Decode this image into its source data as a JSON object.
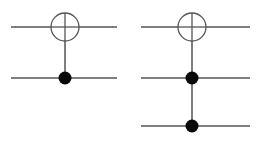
{
  "figure": {
    "width": 261,
    "height": 151,
    "background_color": "#ffffff",
    "wire_color": "#7f7f7f",
    "circle_stroke_color": "#555555",
    "circle_fill_color": "#ffffff",
    "dot_color": "#0a0a0a"
  },
  "circuits": [
    {
      "id": "cnot",
      "name": "CNOT gate",
      "label": "",
      "wire_count": 2,
      "x_start": 11,
      "x_end": 117,
      "gate_x": 65,
      "wires": [
        {
          "index": 0,
          "y": 27,
          "role": "target"
        },
        {
          "index": 1,
          "y": 78,
          "role": "control"
        }
      ],
      "target": {
        "cx": 65,
        "cy": 27,
        "r": 14,
        "symbol": "oplus"
      },
      "controls": [
        {
          "cx": 65,
          "cy": 78,
          "r": 6.5
        }
      ],
      "connector": {
        "x": 65,
        "y1": 41,
        "y2": 78
      }
    },
    {
      "id": "toffoli",
      "name": "Toffoli gate",
      "label": "",
      "wire_count": 3,
      "x_start": 141,
      "x_end": 250,
      "gate_x": 192,
      "wires": [
        {
          "index": 0,
          "y": 27,
          "role": "target"
        },
        {
          "index": 1,
          "y": 78,
          "role": "control"
        },
        {
          "index": 2,
          "y": 126,
          "role": "control"
        }
      ],
      "target": {
        "cx": 192,
        "cy": 27,
        "r": 14,
        "symbol": "oplus"
      },
      "controls": [
        {
          "cx": 192,
          "cy": 78,
          "r": 6.5
        },
        {
          "cx": 192,
          "cy": 126,
          "r": 6.5
        }
      ],
      "connector": {
        "x": 192,
        "y1": 41,
        "y2": 126
      }
    }
  ]
}
